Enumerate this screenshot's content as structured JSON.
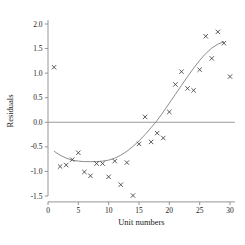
{
  "chart_data": {
    "type": "scatter",
    "title": "",
    "subtitle": "",
    "xlabel": "Unit numbers",
    "ylabel": "Residuals",
    "xlim": [
      0,
      30.8
    ],
    "ylim": [
      -1.62,
      2.08
    ],
    "xticks": [
      0,
      5,
      10,
      15,
      20,
      25,
      30
    ],
    "xticklabels": [
      "0",
      "5",
      "10",
      "15",
      "20",
      "25",
      "30"
    ],
    "yticks": [
      -1.5,
      -1.0,
      -0.5,
      0.0,
      0.5,
      1.0,
      1.5,
      2.0
    ],
    "yticklabels": [
      "-1.5",
      "-1.0",
      "-0.5",
      "0.0",
      "0.5",
      "1.0",
      "1.5",
      "2.0"
    ],
    "grid": false,
    "legend": null,
    "marker": "x",
    "marker_color": "#3c3c3c",
    "curve_color": "#8c8c8c",
    "zero_line_color": "#9a9a9a",
    "zero_line_value": 0.0,
    "series": [
      {
        "name": "Residuals",
        "x": [
          1,
          2,
          3,
          4,
          5,
          6,
          7,
          8,
          9,
          10,
          11,
          12,
          13,
          14,
          15,
          16,
          17,
          18,
          19,
          20,
          21,
          22,
          23,
          24,
          25,
          26,
          27,
          28,
          29,
          30
        ],
        "y": [
          1.12,
          -0.9,
          -0.87,
          -0.76,
          -0.62,
          -1.01,
          -1.09,
          -0.84,
          -0.84,
          -1.11,
          -0.79,
          -1.27,
          -0.82,
          -1.49,
          -0.44,
          0.11,
          -0.4,
          -0.22,
          -0.32,
          0.21,
          0.77,
          1.03,
          0.69,
          0.65,
          1.07,
          1.75,
          1.3,
          1.84,
          1.61,
          0.93
        ]
      }
    ],
    "fit_curve": {
      "name": "fitted-quadratic",
      "x": [
        1.0,
        2.0,
        3.0,
        4.0,
        5.0,
        6.0,
        7.0,
        8.0,
        9.0,
        10.0,
        11.0,
        12.0,
        13.0,
        14.0,
        15.0,
        16.0,
        17.0,
        18.0,
        19.0,
        20.0,
        21.0,
        22.0,
        23.0,
        24.0,
        25.0,
        26.0,
        27.0,
        28.0,
        29.0
      ],
      "y": [
        -0.59,
        -0.67,
        -0.73,
        -0.77,
        -0.79,
        -0.8,
        -0.8,
        -0.8,
        -0.79,
        -0.77,
        -0.73,
        -0.67,
        -0.59,
        -0.49,
        -0.38,
        -0.25,
        -0.11,
        0.04,
        0.21,
        0.39,
        0.57,
        0.75,
        0.93,
        1.1,
        1.26,
        1.4,
        1.51,
        1.59,
        1.64
      ]
    }
  }
}
